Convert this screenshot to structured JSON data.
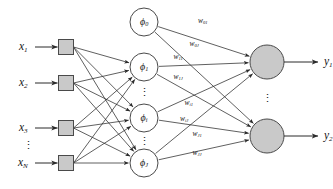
{
  "diagram": {
    "colors": {
      "stroke": "#4a4a4a",
      "edge": "#2b2b2b",
      "input_box_fill": "#c9c9c9",
      "hidden_fill": "#ffffff",
      "output_fill": "#c9c9c9",
      "background": "#ffffff",
      "text": "#141414"
    },
    "ellipsis_glyph": "⋮"
  },
  "inputs": {
    "items": [
      {
        "label": "x",
        "sub": "1",
        "cx": 66,
        "cy": 47
      },
      {
        "label": "x",
        "sub": "2",
        "cx": 66,
        "cy": 83
      },
      {
        "label": "x",
        "sub": "3",
        "cx": 66,
        "cy": 128
      },
      {
        "label": "x",
        "sub": "N",
        "cx": 66,
        "cy": 163
      }
    ],
    "ellipsis_after_index": 2,
    "box_size": 15
  },
  "hidden": {
    "items": [
      {
        "label": "ϕ",
        "sub": "0",
        "cx": 144,
        "cy": 22,
        "r": 14,
        "bias": true
      },
      {
        "label": "ϕ",
        "sub": "1",
        "cx": 144,
        "cy": 67,
        "r": 14,
        "bias": false
      },
      {
        "label": "ϕ",
        "sub": "i",
        "cx": 144,
        "cy": 118,
        "r": 14,
        "bias": false
      },
      {
        "label": "ϕ",
        "sub": "J",
        "cx": 144,
        "cy": 163,
        "r": 14,
        "bias": false
      }
    ],
    "ellipsis_between": [
      {
        "cx": 144,
        "cy": 93
      },
      {
        "cx": 144,
        "cy": 142
      }
    ]
  },
  "outputs": {
    "items": [
      {
        "label": "y",
        "sub": "1",
        "cx": 267,
        "cy": 62,
        "r": 17
      },
      {
        "label": "y",
        "sub": "2",
        "cx": 267,
        "cy": 136,
        "r": 17
      }
    ],
    "ellipsis_between": [
      {
        "cx": 267,
        "cy": 99
      }
    ]
  },
  "weights": [
    {
      "label": "w",
      "sub": "01",
      "x": 203,
      "y": 21
    },
    {
      "label": "w",
      "sub": "0J",
      "x": 194,
      "y": 44
    },
    {
      "label": "w",
      "sub": "11",
      "x": 178,
      "y": 57
    },
    {
      "label": "w",
      "sub": "1J",
      "x": 178,
      "y": 77
    },
    {
      "label": "w",
      "sub": "i1",
      "x": 189,
      "y": 103
    },
    {
      "label": "w",
      "sub": "iJ",
      "x": 184,
      "y": 119
    },
    {
      "label": "w",
      "sub": "J1",
      "x": 197,
      "y": 134
    },
    {
      "label": "w",
      "sub": "JJ",
      "x": 197,
      "y": 153
    }
  ]
}
